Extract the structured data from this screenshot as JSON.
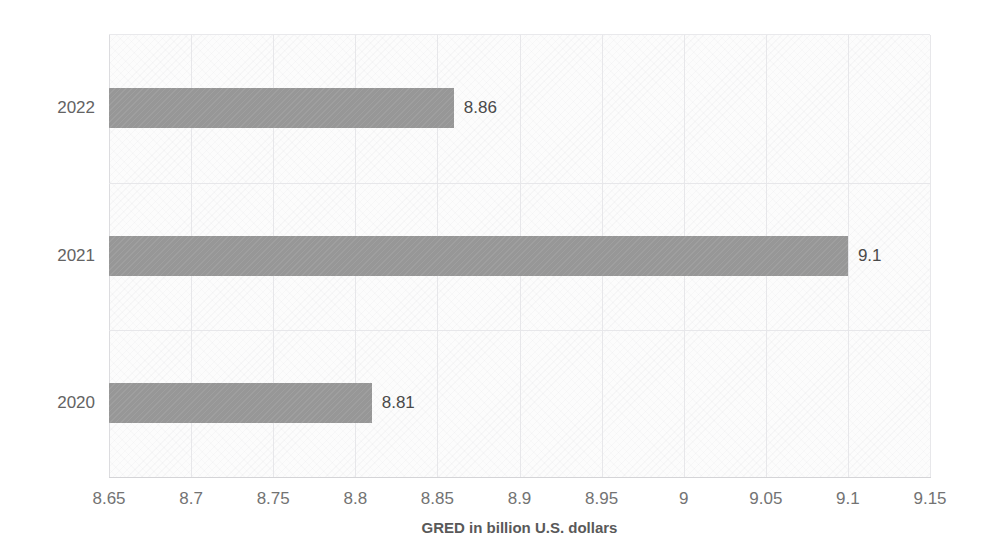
{
  "chart_data": {
    "type": "bar",
    "orientation": "horizontal",
    "title": "",
    "xlabel": "GRED in billion U.S. dollars",
    "ylabel": "",
    "categories": [
      "2022",
      "2021",
      "2020"
    ],
    "values": [
      8.86,
      9.1,
      8.81
    ],
    "value_labels": [
      "8.86",
      "9.1",
      "8.81"
    ],
    "xlim": [
      8.65,
      9.15
    ],
    "xticks": [
      8.65,
      8.7,
      8.75,
      8.8,
      8.85,
      8.9,
      8.95,
      9,
      9.05,
      9.1,
      9.15
    ],
    "xtick_labels": [
      "8.65",
      "8.7",
      "8.75",
      "8.8",
      "8.85",
      "8.9",
      "8.95",
      "9",
      "9.05",
      "9.1",
      "9.15"
    ],
    "grid": true,
    "legend": false,
    "bar_color": "#9a9a9a",
    "plot_background": "#fcfcfc",
    "label_color": "#636363"
  }
}
